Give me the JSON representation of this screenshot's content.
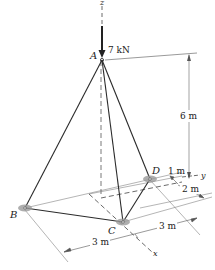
{
  "figure": {
    "type": "3D tripod truss diagram",
    "load": {
      "label": "7 kN",
      "point": "A",
      "direction": "-z"
    },
    "points": {
      "A": "A",
      "B": "B",
      "C": "C",
      "D": "D"
    },
    "axes": {
      "x": "x",
      "y": "y",
      "z": "z"
    },
    "dimensions": {
      "height": "6 m",
      "d_offset": "1 m",
      "d_depth": "2 m",
      "span_left": "3 m",
      "span_right": "3 m"
    },
    "members": [
      "AB",
      "AC",
      "AD",
      "BC",
      "CD"
    ],
    "colors": {
      "line": "#333333",
      "support": "#9a9a9a",
      "thin": "#777777"
    }
  }
}
